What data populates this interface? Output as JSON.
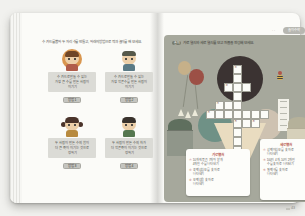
{
  "book": {
    "left_page": {
      "instruction": "수 카드를 뽑아 두 자리 수를 만들고, 아래의 방법으로 짝과 놀이를 해 보세요.",
      "cards": [
        {
          "variant": "v1",
          "lines": [
            "수 카드로 만들 수 있는",
            "가장 큰 수를 만든 사람이",
            "이기기"
          ],
          "button": "방법 1"
        },
        {
          "variant": "v2",
          "lines": [
            "수 카드로 만들 수 있는",
            "가장 작은 수를 만든 사람이",
            "이기기"
          ],
          "button": "방법 2"
        },
        {
          "variant": "v3",
          "lines": [
            "두 사람이 만든 수의 합이",
            "더 큰 쪽이 이기는 것으로",
            "정하기"
          ],
          "button": "방법 3"
        },
        {
          "variant": "v4",
          "lines": [
            "두 사람이 만든 수의 차가",
            "더 작은 쪽이 이기는 것으로",
            "정하기"
          ],
          "button": "방법 4"
        }
      ]
    },
    "right_page": {
      "tab_label": "놀이 수학",
      "tab_dots": "· ·",
      "instruction_marker": "놀이",
      "instruction": "가로 열쇠와 세로 열쇠를 보고 퍼즐을 완성해 보세요.",
      "page_number": "43",
      "clues": {
        "across": {
          "title": "가로 열쇠",
          "items": [
            {
              "num": "②",
              "lines": [
                "10개씩 묶음 7개와 낱개",
                "4개인 수를 나타내기"
              ]
            },
            {
              "num": "④",
              "lines": [
                "육백삼십오를 숫자로",
                "나타내기"
              ]
            },
            {
              "num": "⑥",
              "lines": [
                "오백십을 숫자로",
                "나타내기"
              ]
            }
          ]
        },
        "down": {
          "title": "세로 열쇠",
          "items": [
            {
              "num": "①",
              "lines": [
                "삼백이십오를 숫자로",
                "나타내기"
              ]
            },
            {
              "num": "③",
              "lines": [
                "100이 4개, 10이 2개인",
                "수를 숫자로 나타내기"
              ]
            },
            {
              "num": "⑤",
              "lines": [
                "칠백구를 숫자로",
                "나타내기"
              ]
            }
          ]
        }
      },
      "crossword": {
        "cells": [
          {
            "c": 3,
            "r": 0,
            "n": "①"
          },
          {
            "c": 3,
            "r": 1
          },
          {
            "c": 2,
            "r": 2,
            "n": "②"
          },
          {
            "c": 3,
            "r": 2
          },
          {
            "c": 4,
            "r": 2
          },
          {
            "c": 3,
            "r": 3
          },
          {
            "c": 1,
            "r": 4,
            "n": "③"
          },
          {
            "c": 2,
            "r": 4
          },
          {
            "c": 3,
            "r": 4
          },
          {
            "c": 0,
            "r": 5,
            "n": "④"
          },
          {
            "c": 1,
            "r": 5
          },
          {
            "c": 2,
            "r": 5
          },
          {
            "c": 3,
            "r": 5
          },
          {
            "c": 4,
            "r": 5
          },
          {
            "c": 5,
            "r": 5
          },
          {
            "c": 6,
            "r": 5
          },
          {
            "c": 3,
            "r": 6,
            "n": "⑤"
          },
          {
            "c": 4,
            "r": 6
          },
          {
            "c": 5,
            "r": 6,
            "n": "⑥"
          },
          {
            "c": 3,
            "r": 7
          },
          {
            "c": 3,
            "r": 8
          },
          {
            "c": 3,
            "r": 9
          },
          {
            "c": 3,
            "r": 10
          }
        ]
      }
    }
  },
  "colors": {
    "photo_background": "#f1f1ee",
    "page": "#fbfbf8",
    "panel": "#a6a89c",
    "scoop_dark": "#3b3332",
    "scoop_teal": "#6f9186",
    "scoop_pale": "#cec2b1",
    "cone": "#e9dcc0",
    "balloon_tan": "#c6b089",
    "balloon_red": "#9c5046",
    "clue_accent": "#b5574a",
    "card_box": "#dbdbd6",
    "card_button": "#c4c4bf"
  }
}
